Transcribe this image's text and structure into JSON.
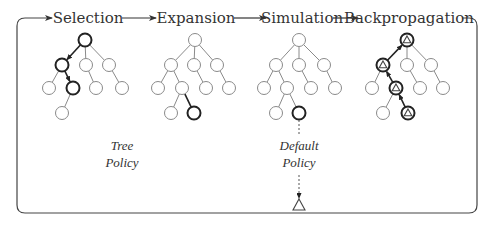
{
  "diagram": {
    "stages": [
      {
        "id": "selection",
        "label": "Selection",
        "x": 88,
        "y": 23
      },
      {
        "id": "expansion",
        "label": "Expansion",
        "x": 196,
        "y": 23
      },
      {
        "id": "simulation",
        "label": "Simulation",
        "x": 302,
        "y": 23
      },
      {
        "id": "backpropagation",
        "label": "Backpropagation",
        "x": 409,
        "y": 23
      }
    ],
    "stage_arrows": [
      {
        "x1": 122,
        "x2": 156,
        "y": 18
      },
      {
        "x1": 234,
        "x2": 266,
        "y": 18
      },
      {
        "x1": 333,
        "x2": 358,
        "y": 18
      }
    ],
    "policies": [
      {
        "id": "tree-policy",
        "lines": [
          "Tree",
          "Policy"
        ],
        "x": 122,
        "y": 150
      },
      {
        "id": "default-policy",
        "lines": [
          "Default",
          "Policy"
        ],
        "x": 299,
        "y": 150
      }
    ],
    "node_radius": 6.5,
    "trees": [
      {
        "stage": "selection",
        "nodes": [
          {
            "x": 85,
            "y": 40,
            "bold": true
          },
          {
            "x": 62,
            "y": 65,
            "bold": true
          },
          {
            "x": 86,
            "y": 65
          },
          {
            "x": 109,
            "y": 65
          },
          {
            "x": 49,
            "y": 88
          },
          {
            "x": 73,
            "y": 88,
            "bold": true
          },
          {
            "x": 96,
            "y": 88
          },
          {
            "x": 122,
            "y": 88
          },
          {
            "x": 62,
            "y": 113
          }
        ],
        "edges": [
          [
            0,
            1,
            "arrow"
          ],
          [
            0,
            2
          ],
          [
            0,
            3
          ],
          [
            1,
            4
          ],
          [
            1,
            5,
            "arrow"
          ],
          [
            2,
            6
          ],
          [
            3,
            7
          ],
          [
            5,
            8
          ]
        ]
      },
      {
        "stage": "expansion",
        "nodes": [
          {
            "x": 195,
            "y": 40
          },
          {
            "x": 171,
            "y": 65
          },
          {
            "x": 194,
            "y": 65
          },
          {
            "x": 217,
            "y": 65
          },
          {
            "x": 158,
            "y": 88
          },
          {
            "x": 182,
            "y": 88
          },
          {
            "x": 206,
            "y": 88
          },
          {
            "x": 229,
            "y": 88
          },
          {
            "x": 171,
            "y": 113
          },
          {
            "x": 194,
            "y": 113,
            "bold": true
          }
        ],
        "edges": [
          [
            0,
            1
          ],
          [
            0,
            2
          ],
          [
            0,
            3
          ],
          [
            1,
            4
          ],
          [
            1,
            5
          ],
          [
            2,
            6
          ],
          [
            3,
            7
          ],
          [
            5,
            8
          ],
          [
            5,
            9,
            "bold"
          ]
        ]
      },
      {
        "stage": "simulation",
        "nodes": [
          {
            "x": 299,
            "y": 40
          },
          {
            "x": 276,
            "y": 65
          },
          {
            "x": 299,
            "y": 65
          },
          {
            "x": 324,
            "y": 65
          },
          {
            "x": 264,
            "y": 88
          },
          {
            "x": 287,
            "y": 88
          },
          {
            "x": 311,
            "y": 88
          },
          {
            "x": 335,
            "y": 88
          },
          {
            "x": 276,
            "y": 113
          },
          {
            "x": 299,
            "y": 113,
            "bold": true
          }
        ],
        "edges": [
          [
            0,
            1
          ],
          [
            0,
            2
          ],
          [
            0,
            3
          ],
          [
            1,
            4
          ],
          [
            1,
            5
          ],
          [
            2,
            6
          ],
          [
            3,
            7
          ],
          [
            5,
            8
          ],
          [
            5,
            9
          ]
        ]
      },
      {
        "stage": "backpropagation",
        "nodes": [
          {
            "x": 407,
            "y": 40,
            "bold": true,
            "triangle": true
          },
          {
            "x": 383,
            "y": 65,
            "bold": true,
            "triangle": true
          },
          {
            "x": 407,
            "y": 65
          },
          {
            "x": 431,
            "y": 65
          },
          {
            "x": 372,
            "y": 88
          },
          {
            "x": 396,
            "y": 88,
            "bold": true,
            "triangle": true
          },
          {
            "x": 420,
            "y": 88
          },
          {
            "x": 443,
            "y": 88
          },
          {
            "x": 383,
            "y": 113
          },
          {
            "x": 408,
            "y": 113,
            "bold": true,
            "triangle": true
          }
        ],
        "edges": [
          [
            1,
            0,
            "arrow"
          ],
          [
            0,
            2
          ],
          [
            0,
            3
          ],
          [
            1,
            4
          ],
          [
            5,
            1,
            "arrow"
          ],
          [
            2,
            6
          ],
          [
            3,
            7
          ],
          [
            5,
            8
          ],
          [
            9,
            5,
            "arrow"
          ]
        ]
      }
    ],
    "rollout": {
      "from_x": 299,
      "from_y": 120,
      "to_y": 198,
      "terminal": {
        "x": 299,
        "y": 205
      }
    },
    "loop": {
      "left": 17,
      "right": 477,
      "top": 18,
      "bottom": 213,
      "radius": 8,
      "start_x": 52,
      "end_x": 462
    },
    "colors": {
      "thin": "#8a8a8a",
      "bold": "#222222",
      "text": "#333333"
    }
  }
}
